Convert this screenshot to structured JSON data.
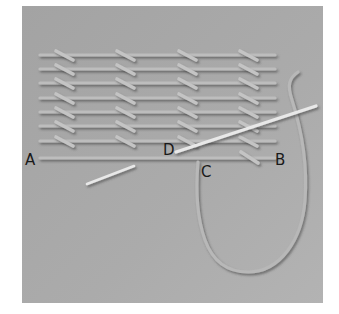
{
  "diagram": {
    "background_color": "#a9a9a9",
    "thread_color": "#bdbdbd",
    "needle_color": "#e6e6e6",
    "panel": {
      "x": 22,
      "y": 6,
      "width": 301,
      "height": 297
    },
    "rows_y": [
      55,
      69,
      83,
      98,
      112,
      126,
      141
    ],
    "base_line_y": 158,
    "row_x_start": 40,
    "row_x_end": 275,
    "stitch_columns_x": [
      56,
      117,
      179,
      240
    ],
    "labels": {
      "A": "A",
      "B": "B",
      "C": "C",
      "D": "D"
    }
  }
}
